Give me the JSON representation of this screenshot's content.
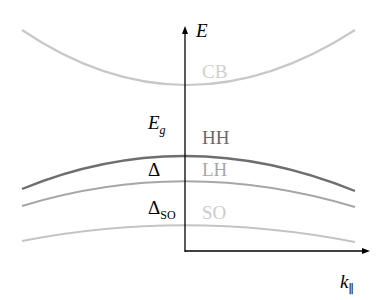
{
  "axes": {
    "y_label": "E",
    "x_label": "k",
    "x_label_sub": "∥"
  },
  "bands": [
    {
      "name": "CB",
      "color": "#c8c8c8"
    },
    {
      "name": "HH",
      "color": "#707070"
    },
    {
      "name": "LH",
      "color": "#a8a8a8"
    },
    {
      "name": "SO",
      "color": "#c4c4c4"
    }
  ],
  "annotations": {
    "gap": "E",
    "gap_sub": "g",
    "delta": "Δ",
    "delta_so": "Δ",
    "delta_so_sub": "SO"
  }
}
